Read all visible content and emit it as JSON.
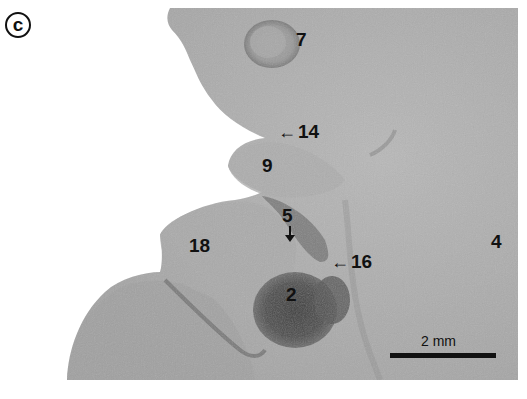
{
  "figure": {
    "panel_label": "c",
    "labels": [
      {
        "id": "7",
        "text": "7"
      },
      {
        "id": "14",
        "text": "14",
        "arrow": "←"
      },
      {
        "id": "9",
        "text": "9"
      },
      {
        "id": "5",
        "text": "5",
        "arrow": "↓"
      },
      {
        "id": "18",
        "text": "18"
      },
      {
        "id": "16",
        "text": "16",
        "arrow": "←"
      },
      {
        "id": "4",
        "text": "4"
      },
      {
        "id": "2",
        "text": "2"
      }
    ],
    "scale_bar": {
      "label": "2 mm"
    },
    "colors": {
      "background": "#ffffff",
      "tissue_light": "#b4b4b4",
      "tissue_mid": "#a6a6a6",
      "tissue_dark": "#4a4a4a",
      "annotation": "#111111"
    }
  }
}
